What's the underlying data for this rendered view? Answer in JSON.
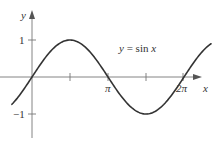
{
  "chart_data": {
    "type": "line",
    "title": "",
    "xlabel": "x",
    "ylabel": "y",
    "annotation": "y = sin x",
    "function": "sin(x)",
    "xlim": [
      -0.83,
      7.4
    ],
    "ylim": [
      -1.6,
      1.8
    ],
    "x_ticks": [
      {
        "value": 1.5708,
        "label": ""
      },
      {
        "value": 3.1416,
        "label": "π"
      },
      {
        "value": 4.7124,
        "label": ""
      },
      {
        "value": 6.2832,
        "label": "2π"
      }
    ],
    "y_ticks": [
      {
        "value": 1,
        "label": "1"
      },
      {
        "value": -1,
        "label": "−1"
      }
    ],
    "series": [
      {
        "name": "sin x",
        "x": [
          -0.83,
          0,
          0.5236,
          1.0472,
          1.5708,
          2.0944,
          2.618,
          3.1416,
          3.6652,
          4.1888,
          4.7124,
          5.236,
          5.7596,
          6.2832,
          6.8068,
          7.4
        ],
        "y": [
          -0.74,
          0,
          0.5,
          0.866,
          1,
          0.866,
          0.5,
          0,
          -0.5,
          -0.866,
          -1,
          -0.866,
          -0.5,
          0,
          0.5,
          0.9
        ]
      }
    ],
    "grid": false,
    "legend": "none"
  },
  "axes": {
    "x_label": "x",
    "y_label": "y",
    "tick_pi": "π",
    "tick_2pi": "2π",
    "tick_one": "1",
    "tick_neg_one": "−1"
  },
  "annotation": {
    "y_part": "y",
    "eq_part": " = sin ",
    "x_part": "x"
  },
  "colors": {
    "curve": "#333333",
    "axes": "#666666",
    "background": "#ffffff"
  }
}
